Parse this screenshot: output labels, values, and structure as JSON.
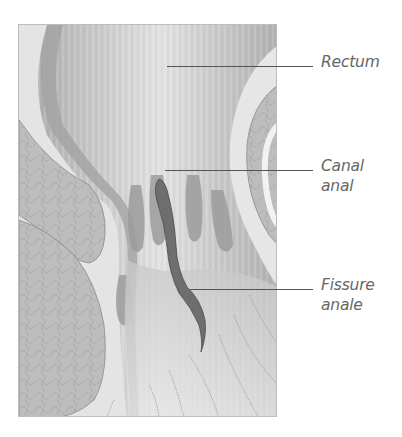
{
  "figure": {
    "colors": {
      "background": "#ffffff",
      "tissue_light": "#e6e6e6",
      "tissue_mid": "#c4c4c4",
      "tissue_dark": "#9a9a9a",
      "fat_lobules": "#b8b8b8",
      "fissure": "#6e6e6e",
      "leader_line": "#555555",
      "label_text": "#666666"
    }
  },
  "labels": [
    {
      "id": "rectum",
      "lines": [
        "Rectum"
      ]
    },
    {
      "id": "canal-anal",
      "lines": [
        "Canal",
        "anal"
      ]
    },
    {
      "id": "fissure-anale",
      "lines": [
        "Fissure",
        "anale"
      ]
    }
  ],
  "caption": {
    "text": ""
  }
}
